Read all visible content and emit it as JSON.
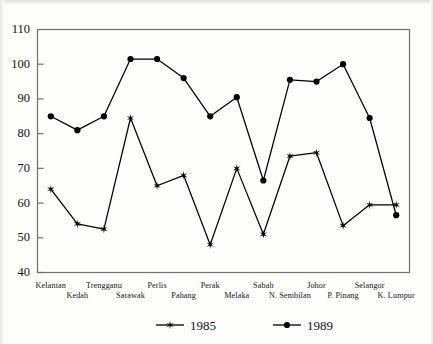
{
  "chart_data": {
    "type": "line",
    "title": "",
    "subtitle": "",
    "xlabel": "",
    "ylabel": "",
    "ylim": [
      40,
      110
    ],
    "ytick_step": 10,
    "yticks": [
      40,
      50,
      60,
      70,
      80,
      90,
      100,
      110
    ],
    "grid": false,
    "legend_position": "bottom",
    "categories": [
      "Kelantan",
      "Kedah",
      "Trengganu",
      "Sarawak",
      "Perlis",
      "Pahang",
      "Perak",
      "Melaka",
      "Sabah",
      "N. Sembilan",
      "Johor",
      "P. Pinang",
      "Selangor",
      "K. Lumpur"
    ],
    "series": [
      {
        "name": "1985",
        "marker": "star",
        "color": "#000000",
        "values": [
          64,
          54,
          52.5,
          84.5,
          65,
          68,
          48,
          70,
          51,
          73.5,
          74.5,
          53.5,
          59.5,
          59.5
        ]
      },
      {
        "name": "1989",
        "marker": "circle",
        "color": "#000000",
        "values": [
          85,
          81,
          85,
          101.5,
          101.5,
          96,
          85,
          90.5,
          66.5,
          95.5,
          95,
          100,
          84.5,
          56.5
        ]
      }
    ]
  },
  "legend": {
    "entries": [
      {
        "label": "1985",
        "marker": "star"
      },
      {
        "label": "1989",
        "marker": "circle"
      }
    ]
  },
  "axis": {
    "y_tick_labels": [
      "110",
      "100",
      "90",
      "80",
      "70",
      "60",
      "50",
      "40"
    ]
  }
}
